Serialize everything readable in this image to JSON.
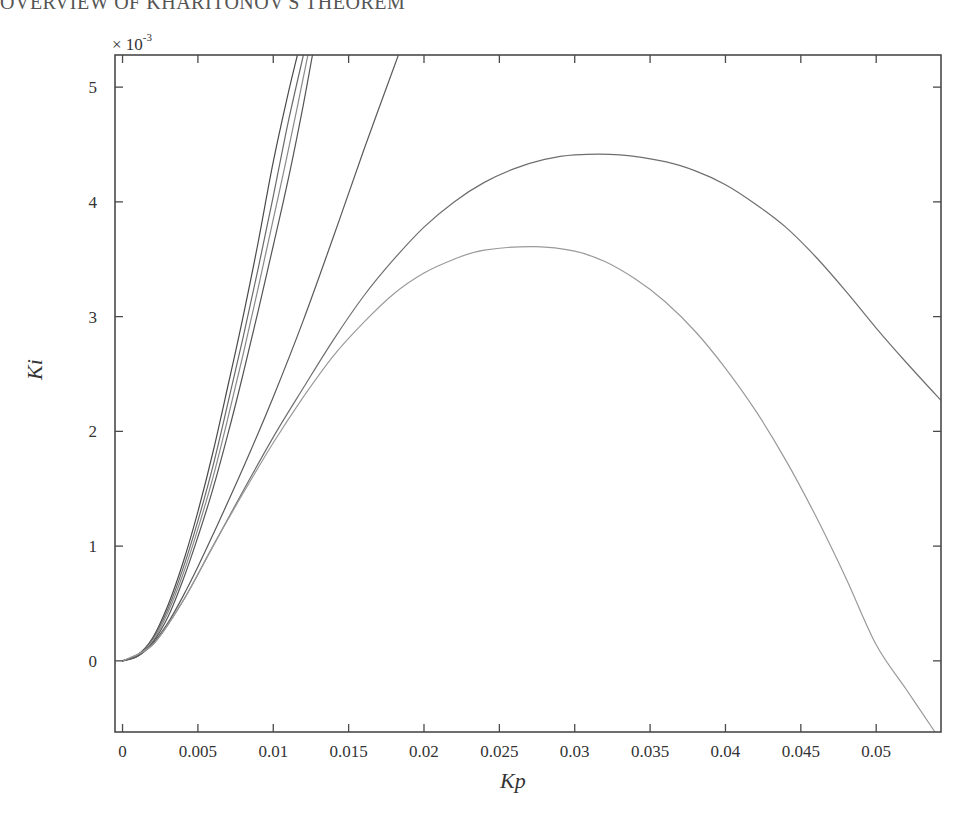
{
  "page": {
    "running_head": "OVERVIEW OF KHARITONOV'S THEOREM"
  },
  "chart_data": {
    "type": "line",
    "title": "",
    "xlabel": "Kp",
    "ylabel": "Ki",
    "y_scale_label": "× 10",
    "y_scale_exponent": "-3",
    "xlim": [
      -0.0005,
      0.0543
    ],
    "ylim": [
      -0.62,
      5.28
    ],
    "y_units_multiplier": 0.001,
    "grid": false,
    "legend": null,
    "x_ticks": [
      0,
      0.005,
      0.01,
      0.015,
      0.02,
      0.025,
      0.03,
      0.035,
      0.04,
      0.045,
      0.05
    ],
    "x_tick_labels": [
      "0",
      "0.005",
      "0.01",
      "0.015",
      "0.02",
      "0.025",
      "0.03",
      "0.035",
      "0.04",
      "0.045",
      "0.05"
    ],
    "y_ticks": [
      0,
      1,
      2,
      3,
      4,
      5
    ],
    "y_tick_labels": [
      "0",
      "1",
      "2",
      "3",
      "4",
      "5"
    ],
    "series": [
      {
        "name": "stability boundary 1",
        "color": "#4a4a4a",
        "x": [
          0,
          0.001,
          0.002,
          0.003,
          0.004,
          0.005,
          0.006,
          0.007,
          0.008,
          0.009,
          0.01,
          0.011,
          0.0116
        ],
        "y": [
          0,
          0.05,
          0.2,
          0.48,
          0.85,
          1.3,
          1.82,
          2.4,
          3.0,
          3.65,
          4.35,
          4.95,
          5.28
        ]
      },
      {
        "name": "stability boundary 2",
        "color": "#6a6a6a",
        "x": [
          0,
          0.001,
          0.002,
          0.003,
          0.004,
          0.005,
          0.006,
          0.007,
          0.008,
          0.009,
          0.01,
          0.011,
          0.012
        ],
        "y": [
          0,
          0.05,
          0.19,
          0.45,
          0.8,
          1.22,
          1.7,
          2.25,
          2.82,
          3.42,
          4.05,
          4.7,
          5.28
        ]
      },
      {
        "name": "stability boundary 3",
        "color": "#8a8a8a",
        "x": [
          0,
          0.001,
          0.002,
          0.003,
          0.004,
          0.005,
          0.006,
          0.007,
          0.008,
          0.009,
          0.01,
          0.011,
          0.0123
        ],
        "y": [
          0,
          0.04,
          0.17,
          0.42,
          0.75,
          1.15,
          1.6,
          2.12,
          2.67,
          3.25,
          3.85,
          4.45,
          5.28
        ]
      },
      {
        "name": "stability boundary 4",
        "color": "#555555",
        "x": [
          0,
          0.001,
          0.002,
          0.003,
          0.004,
          0.005,
          0.006,
          0.007,
          0.008,
          0.009,
          0.01,
          0.011,
          0.012,
          0.0126
        ],
        "y": [
          0,
          0.04,
          0.16,
          0.38,
          0.7,
          1.08,
          1.5,
          1.98,
          2.5,
          3.05,
          3.62,
          4.2,
          4.85,
          5.28
        ]
      },
      {
        "name": "stability boundary 5",
        "color": "#5a5a5a",
        "x": [
          0,
          0.001,
          0.002,
          0.003,
          0.004,
          0.005,
          0.006,
          0.008,
          0.01,
          0.012,
          0.014,
          0.016,
          0.0183
        ],
        "y": [
          0,
          0.04,
          0.15,
          0.33,
          0.56,
          0.82,
          1.1,
          1.68,
          2.3,
          2.97,
          3.7,
          4.45,
          5.28
        ]
      },
      {
        "name": "stability boundary 6 (upper arch)",
        "color": "#6e6e6e",
        "x": [
          0,
          0.002,
          0.004,
          0.006,
          0.008,
          0.01,
          0.012,
          0.014,
          0.016,
          0.018,
          0.02,
          0.022,
          0.024,
          0.026,
          0.028,
          0.03,
          0.033,
          0.036,
          0.038,
          0.04,
          0.042,
          0.044,
          0.046,
          0.048,
          0.05,
          0.052,
          0.0543
        ],
        "y": [
          0,
          0.14,
          0.52,
          1.0,
          1.48,
          1.95,
          2.38,
          2.8,
          3.18,
          3.5,
          3.78,
          4.0,
          4.17,
          4.29,
          4.37,
          4.41,
          4.41,
          4.35,
          4.27,
          4.15,
          3.98,
          3.78,
          3.52,
          3.22,
          2.9,
          2.6,
          2.27
        ]
      },
      {
        "name": "stability boundary 7 (lower arch)",
        "color": "#9a9a9a",
        "x": [
          0,
          0.002,
          0.004,
          0.006,
          0.008,
          0.01,
          0.012,
          0.014,
          0.016,
          0.018,
          0.02,
          0.022,
          0.024,
          0.0274,
          0.03,
          0.032,
          0.034,
          0.036,
          0.038,
          0.04,
          0.042,
          0.044,
          0.046,
          0.048,
          0.05,
          0.052,
          0.0539
        ],
        "y": [
          0,
          0.14,
          0.52,
          1.0,
          1.46,
          1.9,
          2.3,
          2.66,
          2.95,
          3.2,
          3.38,
          3.5,
          3.58,
          3.61,
          3.57,
          3.48,
          3.33,
          3.13,
          2.87,
          2.55,
          2.18,
          1.75,
          1.26,
          0.72,
          0.14,
          -0.25,
          -0.62
        ]
      }
    ]
  }
}
